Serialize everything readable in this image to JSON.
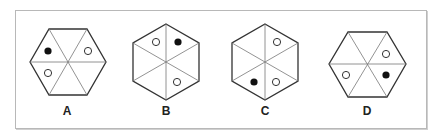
{
  "options": [
    {
      "label": "A",
      "orientation": "flat-top",
      "cx": 68,
      "cy": 62,
      "r": 38,
      "dots": [
        {
          "sector": "upper-left",
          "fill": "black"
        },
        {
          "sector": "upper-right",
          "fill": "white"
        },
        {
          "sector": "lower-left",
          "fill": "white"
        }
      ]
    },
    {
      "label": "B",
      "orientation": "pointy-top",
      "cx": 166,
      "cy": 62,
      "r": 38,
      "dots": [
        {
          "sector": "top-left",
          "fill": "white"
        },
        {
          "sector": "top-right",
          "fill": "black"
        },
        {
          "sector": "bottom-right",
          "fill": "white"
        }
      ]
    },
    {
      "label": "C",
      "orientation": "pointy-top",
      "cx": 265,
      "cy": 62,
      "r": 38,
      "dots": [
        {
          "sector": "top-right",
          "fill": "white"
        },
        {
          "sector": "bottom-left",
          "fill": "black"
        },
        {
          "sector": "bottom-right",
          "fill": "white"
        }
      ]
    },
    {
      "label": "D",
      "orientation": "flat-top",
      "cx": 367,
      "cy": 64,
      "r": 38,
      "dots": [
        {
          "sector": "upper-right",
          "fill": "white"
        },
        {
          "sector": "lower-right",
          "fill": "black"
        },
        {
          "sector": "lower-left",
          "fill": "white"
        }
      ]
    }
  ],
  "colors": {
    "stroke": "#333333",
    "inner_line": "#777777",
    "dot_black": "#111111",
    "dot_white": "#ffffff"
  }
}
